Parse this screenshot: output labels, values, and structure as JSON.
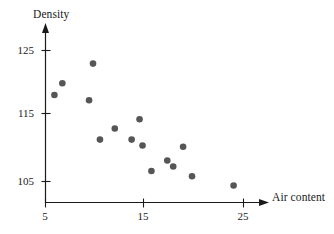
{
  "chart_data": {
    "type": "scatter",
    "title": "",
    "xlabel": "Air content",
    "ylabel": "Density",
    "xlim": [
      2.0,
      27.5
    ],
    "ylim": [
      101.5,
      127.0
    ],
    "xticks": [
      5,
      15,
      25
    ],
    "xtick_labels": [
      "5",
      "15",
      "25"
    ],
    "yticks": [
      105,
      115,
      125
    ],
    "ytick_labels": [
      "105",
      "115",
      "125"
    ],
    "grid": false,
    "legend": null,
    "marker": {
      "shape": "circle",
      "color": "#565658",
      "size_px": 3.3
    },
    "axis_style": "arrow-terminated open axes",
    "n_points": 15,
    "x": [
      9.8,
      6.7,
      5.9,
      9.4,
      14.5,
      12.0,
      10.5,
      13.7,
      14.8,
      18.9,
      17.3,
      17.9,
      15.7,
      19.8,
      24.0
    ],
    "y": [
      123.0,
      120.0,
      118.2,
      117.4,
      114.5,
      113.1,
      111.4,
      111.4,
      110.5,
      110.3,
      108.2,
      107.3,
      106.6,
      105.8,
      104.4
    ],
    "points": [
      {
        "air_content": 9.8,
        "density": 123.0
      },
      {
        "air_content": 6.7,
        "density": 120.0
      },
      {
        "air_content": 5.9,
        "density": 118.2
      },
      {
        "air_content": 9.4,
        "density": 117.4
      },
      {
        "air_content": 14.5,
        "density": 114.5
      },
      {
        "air_content": 12.0,
        "density": 113.1
      },
      {
        "air_content": 10.5,
        "density": 111.4
      },
      {
        "air_content": 13.7,
        "density": 111.4
      },
      {
        "air_content": 14.8,
        "density": 110.5
      },
      {
        "air_content": 18.9,
        "density": 110.3
      },
      {
        "air_content": 17.3,
        "density": 108.2
      },
      {
        "air_content": 17.9,
        "density": 107.3
      },
      {
        "air_content": 15.7,
        "density": 106.6
      },
      {
        "air_content": 19.8,
        "density": 105.8
      },
      {
        "air_content": 24.0,
        "density": 104.4
      }
    ]
  },
  "labels": {
    "y_axis_title": "Density",
    "x_axis_title": "Air content",
    "ytick_105": "105",
    "ytick_115": "115",
    "ytick_125": "125",
    "xtick_5": "5",
    "xtick_15": "15",
    "xtick_25": "25"
  },
  "colors": {
    "marker": "#565658",
    "axis": "#1a1a1a",
    "background": "#ffffff"
  }
}
